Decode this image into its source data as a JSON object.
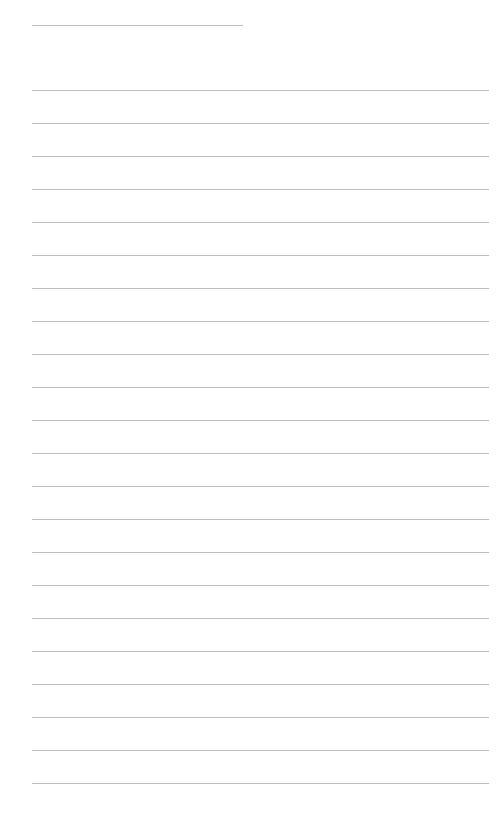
{
  "document": {
    "type": "blank lined writing page",
    "line_color": "#bdbdbd",
    "background_color": "#ffffff",
    "header_line": {
      "present": true,
      "text": ""
    },
    "ruled_line_count": 22,
    "lines": [
      "",
      "",
      "",
      "",
      "",
      "",
      "",
      "",
      "",
      "",
      "",
      "",
      "",
      "",
      "",
      "",
      "",
      "",
      "",
      "",
      "",
      ""
    ]
  }
}
